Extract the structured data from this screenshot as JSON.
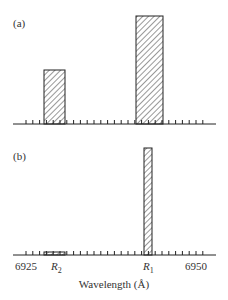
{
  "chart_data": [
    {
      "type": "bar",
      "panel_label": "(a)",
      "xlim": [
        6923,
        6955
      ],
      "bars": [
        {
          "name": "R2",
          "x_start": 6927.7,
          "x_end": 6930.8,
          "height": 0.5
        },
        {
          "name": "R1",
          "x_start": 6941.5,
          "x_end": 6945.5,
          "height": 1.0
        }
      ],
      "fill": "hatched"
    },
    {
      "type": "bar",
      "panel_label": "(b)",
      "xlim": [
        6923,
        6955
      ],
      "bars": [
        {
          "name": "R2",
          "x_start": 6927.7,
          "x_end": 6930.8,
          "height": 0.03
        },
        {
          "name": "R1",
          "x_start": 6942.7,
          "x_end": 6943.9,
          "height": 1.0
        }
      ],
      "fill": "hatched",
      "tick_labels": [
        {
          "value": 6925,
          "text": "6925"
        },
        {
          "value": 6950,
          "text": "6950"
        }
      ],
      "line_labels": [
        {
          "value": 6929.2,
          "text": "R",
          "sub": "2"
        },
        {
          "value": 6943.3,
          "text": "R",
          "sub": "1"
        }
      ],
      "xlabel": "Wavelength (Å)",
      "minor_tick_step": 1
    }
  ],
  "labels": {
    "panel_a": "(a)",
    "panel_b": "(b)",
    "tick_6925": "6925",
    "tick_6950": "6950",
    "r1_main": "R",
    "r1_sub": "1",
    "r2_main": "R",
    "r2_sub": "2",
    "xlabel": "Wavelength (Å)"
  }
}
